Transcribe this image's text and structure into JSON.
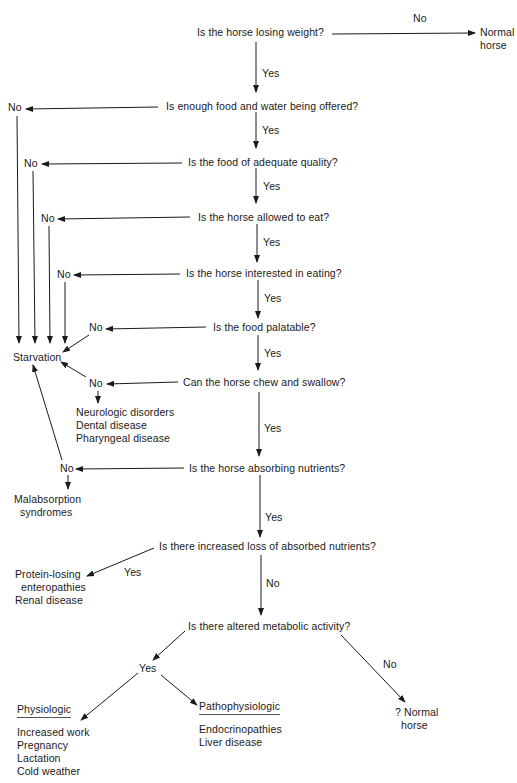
{
  "diagram": {
    "type": "flowchart",
    "questions": {
      "q1": "Is the horse losing weight?",
      "q2": "Is enough food and water being offered?",
      "q3": "Is the food of adequate quality?",
      "q4": "Is the horse allowed to eat?",
      "q5": "Is the horse interested in eating?",
      "q6": "Is the food palatable?",
      "q7": "Can the horse chew and swallow?",
      "q8": "Is the horse absorbing nutrients?",
      "q9": "Is there increased loss of absorbed nutrients?",
      "q10": "Is there altered metabolic activity?"
    },
    "edge_labels": {
      "yes": "Yes",
      "no": "No"
    },
    "outcomes": {
      "normal_horse_top": "Normal\nhorse",
      "starvation": "Starvation",
      "chew_causes": "Neurologic disorders\nDental disease\nPharyngeal disease",
      "malabsorption": "Malabsorption\n  syndromes",
      "loss_causes": "Protein-losing\n  enteropathies\nRenal disease",
      "physiologic_heading": "Physiologic",
      "physiologic_causes": "Increased work\nPregnancy\nLactation\nCold weather",
      "pathophysiologic_heading": "Pathophysiologic",
      "pathophysiologic_causes": "Endocrinopathies\nLiver disease",
      "normal_horse_bottom": "? Normal\n  horse"
    }
  }
}
